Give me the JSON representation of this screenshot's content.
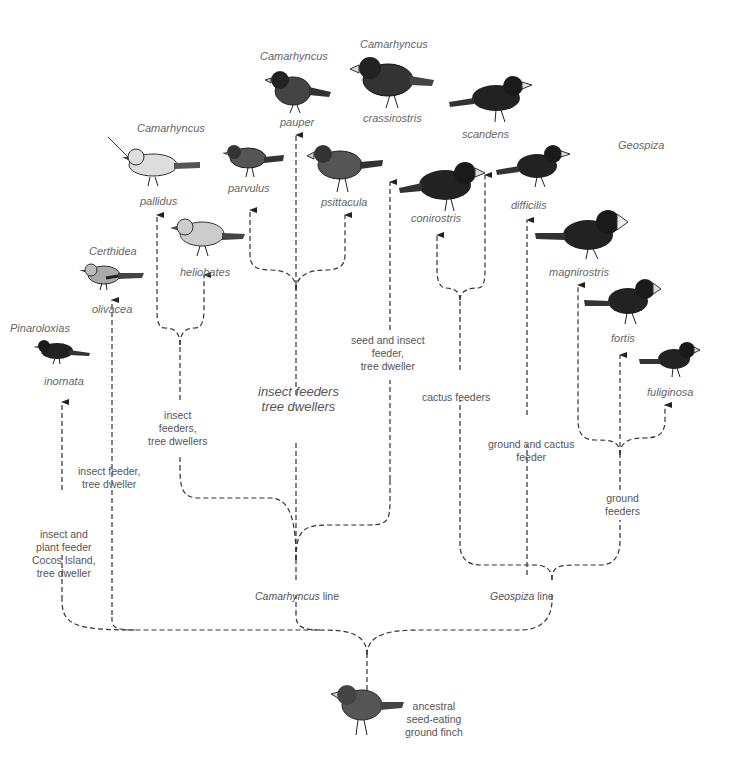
{
  "diagram": {
    "ancestor": {
      "label": "ancestral\nseed-eating\nground finch"
    },
    "lines": {
      "camarhyncus": {
        "genus": "Camarhyncus",
        "suffix": " line"
      },
      "geospiza": {
        "genus": "Geospiza",
        "suffix": " line"
      }
    },
    "group_labels": {
      "insect_tree_main": "insect feeders\ntree dwellers",
      "insect_feeders_tree_dwellers": "insect\nfeeders,\ntree dwellers",
      "seed_insect": "seed and insect\nfeeder,\ntree dweller",
      "cactus_feeders": "cactus feeders",
      "ground_cactus": "ground and cactus\nfeeder",
      "ground_feeders": "ground\nfeeders",
      "insect_feeder_tree_dweller": "insect feeder,\ntree dweller",
      "cocos": "insect and\nplant feeder\nCocos Island,\ntree dweller"
    },
    "genera": {
      "pinaroloxias": "Pinaroloxias",
      "certhidea": "Certhidea",
      "camarhyncus_1": "Camarhyncus",
      "camarhyncus_2": "Camarhyncus",
      "camarhyncus_3": "Camarhyncus",
      "geospiza": "Geospiza"
    },
    "species": [
      {
        "name": "inornata"
      },
      {
        "name": "olivacea"
      },
      {
        "name": "pallidus"
      },
      {
        "name": "heliobates"
      },
      {
        "name": "parvulus"
      },
      {
        "name": "pauper"
      },
      {
        "name": "psittacula"
      },
      {
        "name": "crassirostris"
      },
      {
        "name": "conirostris"
      },
      {
        "name": "scandens"
      },
      {
        "name": "difficilis"
      },
      {
        "name": "magnirostris"
      },
      {
        "name": "fortis"
      },
      {
        "name": "fuliginosa"
      }
    ]
  }
}
